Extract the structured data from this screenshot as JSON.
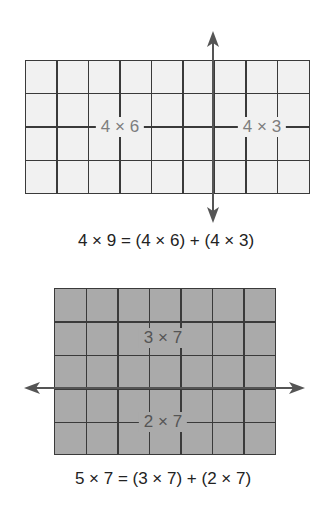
{
  "diagram": {
    "top_model": {
      "rows": 4,
      "columns": 9,
      "split_after_column": 6,
      "split_orientation": "vertical",
      "fill_color": "#f1f1f1",
      "left_label": "4 × 6",
      "right_label": "4 × 3",
      "equation": "4 × 9 = (4 × 6) + (4 × 3)"
    },
    "bottom_model": {
      "rows": 5,
      "columns": 7,
      "split_after_row": 3,
      "split_orientation": "horizontal",
      "fill_color": "#aaaaaa",
      "top_label": "3 × 7",
      "bottom_label": "2 × 7",
      "equation": "5 × 7 = (3 × 7) + (2 × 7)"
    },
    "colors": {
      "grid_line": "#3a3a3a",
      "arrow": "#555555",
      "label_text": "#7d7d7d",
      "equation_text": "#222222"
    }
  }
}
